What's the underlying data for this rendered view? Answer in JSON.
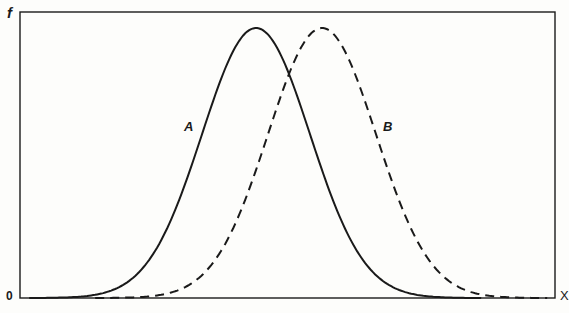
{
  "figure": {
    "axis_labels": {
      "y": "f",
      "x": "X",
      "origin": "0"
    },
    "curves": [
      {
        "id": "A",
        "label": "A",
        "style": "solid",
        "center_px": 256,
        "sigma_px": 54,
        "peak_y_px": 28
      },
      {
        "id": "B",
        "label": "B",
        "style": "dashed",
        "center_px": 322,
        "sigma_px": 54,
        "peak_y_px": 28
      }
    ],
    "frame": {
      "left": 20,
      "top": 12,
      "right": 555,
      "bottom": 298
    },
    "colors": {
      "line": "#1a1a1a",
      "background": "#fdfdfb"
    }
  },
  "chart_data": {
    "type": "line",
    "title": "",
    "xlabel": "X",
    "ylabel": "f",
    "origin_label": "0",
    "grid": false,
    "legend": "inline labels A (solid) and B (dashed)",
    "series": [
      {
        "name": "A",
        "style": "solid",
        "shape": "normal distribution",
        "relative_mean": 0.44,
        "peak": 1.0
      },
      {
        "name": "B",
        "style": "dashed",
        "shape": "normal distribution",
        "relative_mean": 0.56,
        "peak": 1.0
      }
    ],
    "annotations": [
      "A",
      "B"
    ]
  }
}
